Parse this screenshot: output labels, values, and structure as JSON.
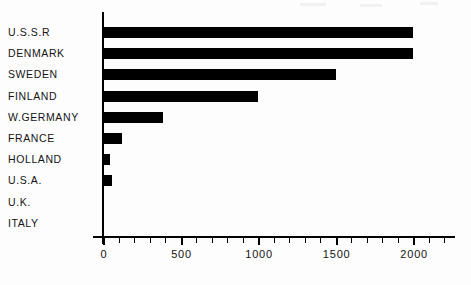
{
  "chart_data": {
    "type": "bar",
    "orientation": "horizontal",
    "title": "",
    "subtitle": "",
    "xlabel": "",
    "ylabel": "",
    "categories": [
      "U.S.S.R",
      "DENMARK",
      "SWEDEN",
      "FINLAND",
      "W.GERMANY",
      "FRANCE",
      "HOLLAND",
      "U.S.A.",
      "U.K.",
      "ITALY"
    ],
    "values": [
      2000,
      2000,
      1500,
      1000,
      390,
      120,
      45,
      60,
      0,
      0
    ],
    "xlim": [
      0,
      2270
    ],
    "ylim": null,
    "xticks": [
      0,
      500,
      1000,
      1500,
      2000
    ],
    "xticklabels": [
      "0",
      "500",
      "1000",
      "1500",
      "2000"
    ],
    "minor_tick_interval": 100,
    "grid": false,
    "legend": null,
    "bar_color": "#000000",
    "axis_color": "#000000",
    "background": "#fdfdfd"
  },
  "axis": {
    "ticks": [
      {
        "value": 0,
        "label": "0",
        "major": true
      },
      {
        "value": 100,
        "label": "",
        "major": false
      },
      {
        "value": 200,
        "label": "",
        "major": false
      },
      {
        "value": 300,
        "label": "",
        "major": false
      },
      {
        "value": 400,
        "label": "",
        "major": false
      },
      {
        "value": 500,
        "label": "500",
        "major": true
      },
      {
        "value": 600,
        "label": "",
        "major": false
      },
      {
        "value": 700,
        "label": "",
        "major": false
      },
      {
        "value": 800,
        "label": "",
        "major": false
      },
      {
        "value": 900,
        "label": "",
        "major": false
      },
      {
        "value": 1000,
        "label": "1000",
        "major": true
      },
      {
        "value": 1100,
        "label": "",
        "major": false
      },
      {
        "value": 1200,
        "label": "",
        "major": false
      },
      {
        "value": 1300,
        "label": "",
        "major": false
      },
      {
        "value": 1400,
        "label": "",
        "major": false
      },
      {
        "value": 1500,
        "label": "1500",
        "major": true
      },
      {
        "value": 1600,
        "label": "",
        "major": false
      },
      {
        "value": 1700,
        "label": "",
        "major": false
      },
      {
        "value": 1800,
        "label": "",
        "major": false
      },
      {
        "value": 1900,
        "label": "",
        "major": false
      },
      {
        "value": 2000,
        "label": "2000",
        "major": true
      },
      {
        "value": 2100,
        "label": "",
        "major": false
      },
      {
        "value": 2200,
        "label": "",
        "major": false
      }
    ]
  },
  "layout": {
    "origin_x_px": 103,
    "px_per_unit": 0.1551,
    "first_row_top_px": 22,
    "row_pitch_px": 21.2
  }
}
